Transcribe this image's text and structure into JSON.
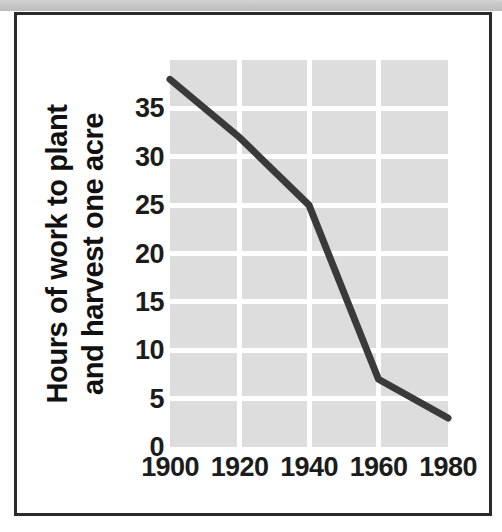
{
  "figure": {
    "frame_color": "#2b2b2b",
    "scan_band_color": "#c9c9c9"
  },
  "chart_data": {
    "type": "line",
    "title": "",
    "subtitle": "",
    "xlabel": "",
    "ylabel": "Hours of work to plant and harvest one acre",
    "ylabel_line1": "Hours of work to plant",
    "ylabel_line2": "and harvest one acre",
    "x": [
      1900,
      1920,
      1940,
      1960,
      1980
    ],
    "values": [
      38,
      32,
      25,
      7,
      3
    ],
    "series": [
      {
        "name": "Hours of work to plant and harvest one acre",
        "values": [
          38,
          32,
          25,
          7,
          3
        ]
      }
    ],
    "categories": [
      "1900",
      "1920",
      "1940",
      "1960",
      "1980"
    ],
    "xtick_labels": [
      "1900",
      "1920",
      "1940",
      "1960",
      "1980"
    ],
    "ytick_labels": [
      "0",
      "5",
      "10",
      "15",
      "20",
      "25",
      "30",
      "35"
    ],
    "ytick_values": [
      0,
      5,
      10,
      15,
      20,
      25,
      30,
      35
    ],
    "xlim": [
      1900,
      1980
    ],
    "ylim": [
      0,
      40
    ],
    "grid": true,
    "grid_color": "#ffffff",
    "plot_background": "#dddddd",
    "line_color": "#3a3a3a",
    "line_width": 7,
    "legend": "none",
    "legend_position": "none",
    "annotations": []
  }
}
